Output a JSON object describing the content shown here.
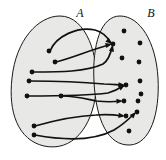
{
  "figure": {
    "kind": "set-mapping-diagram",
    "width": 166,
    "height": 160,
    "background_color": "#ffffff",
    "region_fill_color": "#e8e8e6",
    "outline_color": "#1a1a1a",
    "dot_color": "#111111",
    "arrow_color": "#111111"
  },
  "sets": [
    {
      "id": "A",
      "label": "A",
      "label_x": 80,
      "label_y": 17,
      "outline": "M 60 16 C 38 16, 16 40, 12 78 C 8 112, 18 140, 44 146 C 72 152, 92 128, 96 92 C 100 56, 86 16, 60 16 Z"
    },
    {
      "id": "B",
      "label": "B",
      "label_x": 151,
      "label_y": 17,
      "outline": "M 120 16 C 101 16, 92 44, 94 82 C 96 120, 108 146, 130 145 C 150 144, 160 114, 158 78 C 156 42, 140 16, 120 16 Z"
    }
  ],
  "elements_a": [
    {
      "id": "a1",
      "x": 49,
      "y": 51
    },
    {
      "id": "a2",
      "x": 55,
      "y": 62
    },
    {
      "id": "a3",
      "x": 32,
      "y": 72
    },
    {
      "id": "a4",
      "x": 29,
      "y": 81
    },
    {
      "id": "a5",
      "x": 27,
      "y": 96
    },
    {
      "id": "a6",
      "x": 61,
      "y": 96
    },
    {
      "id": "a7",
      "x": 34,
      "y": 126
    },
    {
      "id": "a8",
      "x": 34,
      "y": 135
    }
  ],
  "elements_b": [
    {
      "id": "b1",
      "x": 124,
      "y": 31
    },
    {
      "id": "b2",
      "x": 140,
      "y": 43
    },
    {
      "id": "b3",
      "x": 113,
      "y": 44
    },
    {
      "id": "b4",
      "x": 122,
      "y": 58
    },
    {
      "id": "b5",
      "x": 139,
      "y": 62
    },
    {
      "id": "b6",
      "x": 140,
      "y": 81
    },
    {
      "id": "b7",
      "x": 126,
      "y": 85
    },
    {
      "id": "b8",
      "x": 141,
      "y": 94
    },
    {
      "id": "b9",
      "x": 124,
      "y": 101
    },
    {
      "id": "b10",
      "x": 138,
      "y": 101
    },
    {
      "id": "b11",
      "x": 137,
      "y": 112
    },
    {
      "id": "b12",
      "x": 126,
      "y": 116
    },
    {
      "id": "b13",
      "x": 129,
      "y": 131
    }
  ],
  "arrows": [
    {
      "id": "arrow-a1-b3",
      "from": "a1",
      "to": "b3",
      "path": "M 50 51 C 56 36, 78 26, 95 30 C 103 32, 108 38, 111 43",
      "head_x": 112,
      "head_y": 44,
      "head_angle": 40
    },
    {
      "id": "arrow-a2-b3",
      "from": "a2",
      "to": "b3",
      "path": "M 56 62 C 72 58, 90 50, 109 45",
      "head_x": 112,
      "head_y": 44,
      "head_angle": -14
    },
    {
      "id": "arrow-a3-b3",
      "from": "a3",
      "to": "b3",
      "path": "M 33 72 C 60 72, 86 72, 103 64 C 109 60, 111 52, 112 47",
      "head_x": 113,
      "head_y": 45,
      "head_angle": -76
    },
    {
      "id": "arrow-a4-b7",
      "from": "a4",
      "to": "b7",
      "path": "M 30 81 C 58 81, 82 82, 104 84 C 112 84, 118 85, 122 85",
      "head_x": 125,
      "head_y": 85,
      "head_angle": 2
    },
    {
      "id": "arrow-a5-b7",
      "from": "a5",
      "to": "b7",
      "path": "M 28 96 C 58 96, 86 96, 108 93 C 115 91, 120 88, 123 86",
      "head_x": 125,
      "head_y": 85,
      "head_angle": -30
    },
    {
      "id": "arrow-a6-b9",
      "from": "a6",
      "to": "b9",
      "path": "M 62 96 C 76 96, 86 99, 96 101 C 106 102, 114 102, 120 101",
      "head_x": 123,
      "head_y": 101,
      "head_angle": -2
    },
    {
      "id": "arrow-a7-b12",
      "from": "a7",
      "to": "b12",
      "path": "M 35 126 C 56 120, 74 116, 96 115 C 108 114, 116 115, 122 116",
      "head_x": 125,
      "head_y": 116,
      "head_angle": 5
    },
    {
      "id": "arrow-a8-b11",
      "from": "a8",
      "to": "b11",
      "path": "M 35 135 C 62 140, 92 142, 114 130 C 124 124, 130 118, 134 114",
      "head_x": 136,
      "head_y": 112,
      "head_angle": -47
    }
  ]
}
